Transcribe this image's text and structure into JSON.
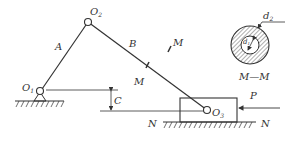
{
  "diagram": {
    "labels": {
      "O1": "O",
      "O1_sub": "1",
      "O2": "O",
      "O2_sub": "2",
      "O3": "O",
      "O3_sub": "3",
      "A": "A",
      "B": "B",
      "C": "C",
      "M_upper": "M",
      "M_lower": "M",
      "P": "P",
      "N_left": "N",
      "N_right": "N",
      "section": "M—M",
      "d2": "d",
      "d2_sub": "2",
      "d1": "d",
      "d1_sub": "1"
    },
    "colors": {
      "stroke": "#333333",
      "background": "#ffffff"
    }
  }
}
